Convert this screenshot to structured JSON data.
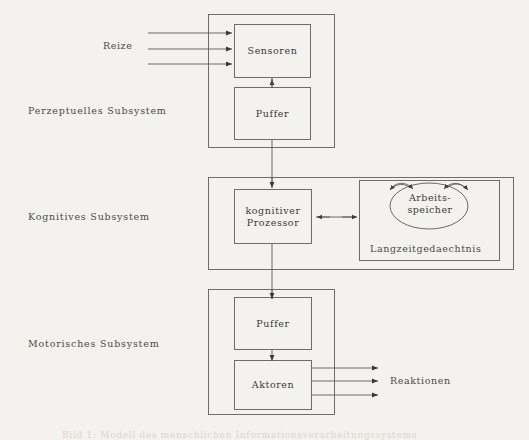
{
  "diagram": {
    "type": "block-diagram",
    "language": "de",
    "title": "Modell des menschlichen Informationsverarbeitungssystems",
    "caption": "Bild 1: Modell des menschlichen Informationsverarbeitungssystems",
    "side_labels": [
      {
        "id": "perceptual",
        "text": "Perzeptuelles Subsystem"
      },
      {
        "id": "cognitive",
        "text": "Kognitives Subsystem"
      },
      {
        "id": "motor",
        "text": "Motorisches Subsystem"
      }
    ],
    "external_labels": [
      {
        "id": "stimuli",
        "text": "Reize"
      },
      {
        "id": "reactions",
        "text": "Reaktionen"
      }
    ],
    "subsystems": [
      {
        "id": "perceptual",
        "label": "Perzeptuelles Subsystem",
        "blocks": [
          {
            "id": "sensoren",
            "text": "Sensoren"
          },
          {
            "id": "puffer-p",
            "text": "Puffer"
          }
        ]
      },
      {
        "id": "cognitive",
        "label": "Kognitives Subsystem",
        "blocks": [
          {
            "id": "kognitiver-prozessor",
            "line1": "kognitiver",
            "line2": "Prozessor"
          },
          {
            "id": "langzeitgedaechtnis",
            "text": "Langzeitgedaechtnis"
          },
          {
            "id": "arbeitsspeicher",
            "line1": "Arbeits-",
            "line2": "speicher"
          }
        ]
      },
      {
        "id": "motor",
        "label": "Motorisches Subsystem",
        "blocks": [
          {
            "id": "puffer-m",
            "text": "Puffer"
          },
          {
            "id": "aktoren",
            "text": "Aktoren"
          }
        ]
      }
    ],
    "connections": [
      {
        "from": "Reize",
        "to": "Sensoren",
        "count": 3,
        "style": "arrow"
      },
      {
        "from": "Sensoren",
        "to": "Puffer",
        "style": "arrow-up"
      },
      {
        "from": "Puffer (perzeptuell)",
        "to": "kognitiver Prozessor",
        "style": "arrow-down"
      },
      {
        "from": "kognitiver Prozessor",
        "to": "Langzeitgedaechtnis",
        "style": "double-arrow"
      },
      {
        "from": "kognitiver Prozessor",
        "to": "Puffer (motorisch)",
        "style": "arrow-down"
      },
      {
        "from": "Puffer (motorisch)",
        "to": "Aktoren",
        "style": "arrow-down"
      },
      {
        "from": "Aktoren",
        "to": "Reaktionen",
        "count": 3,
        "style": "arrow"
      },
      {
        "from": "Arbeitsspeicher",
        "to": "Arbeitsspeicher",
        "count": 4,
        "style": "curved-arc"
      }
    ],
    "colors": {
      "background": "#f4f2ee",
      "stroke": "#6d6d6a",
      "text": "#3a3a38",
      "caption": "#d8d5d0"
    }
  }
}
